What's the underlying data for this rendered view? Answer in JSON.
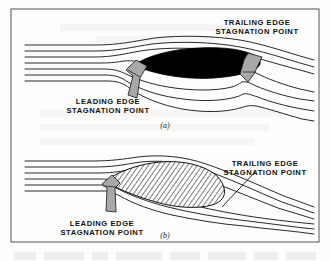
{
  "figure": {
    "kind": "technical-diagram",
    "border_color": "#555555",
    "background_color": "#fdfdfc",
    "ink_color": "#111111",
    "arrow_fill_color": "#a8a8a8",
    "body_fill_color": "#000000",
    "hatch_color": "#111111"
  },
  "panels": [
    {
      "id": "a",
      "letter": "(a)",
      "body_style": "solid-black-ellipse",
      "labels": [
        {
          "name": "leading-edge-stagnation-point",
          "line1": "LEADING  EDGE",
          "line2": "STAGNATION  POINT",
          "x": 108,
          "y": 104,
          "anchor": "middle"
        },
        {
          "name": "trailing-edge-stagnation-point",
          "line1": "TRAILING  EDGE",
          "line2": "STAGNATION  POINT",
          "x": 257,
          "y": 25,
          "anchor": "middle"
        }
      ]
    },
    {
      "id": "b",
      "letter": "(b)",
      "body_style": "hatched-cambered-airfoil",
      "labels": [
        {
          "name": "leading-edge-stagnation-point",
          "line1": "LEADING  EDGE",
          "line2": "STAGNATION  POINT",
          "x": 102,
          "y": 226,
          "anchor": "middle"
        },
        {
          "name": "trailing-edge-stagnation-point",
          "line1": "TRAILING  EDGE",
          "line2": "STAGNATION  POINT",
          "x": 265,
          "y": 166,
          "anchor": "middle"
        }
      ]
    }
  ],
  "text": {
    "leading_edge_line1": "LEADING  EDGE",
    "leading_edge_line2": "STAGNATION  POINT",
    "trailing_edge_line1": "TRAILING  EDGE",
    "trailing_edge_line2": "STAGNATION  POINT",
    "panel_a_letter": "(a)",
    "panel_b_letter": "(b)"
  }
}
